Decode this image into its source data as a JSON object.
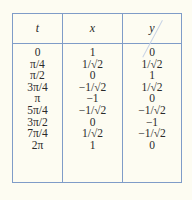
{
  "table": {
    "headers": [
      "t",
      "x",
      "y"
    ],
    "rows": [
      [
        "0",
        "1",
        "0"
      ],
      [
        "π/4",
        "1/√2",
        "1/√2"
      ],
      [
        "π/2",
        "0",
        "1"
      ],
      [
        "3π/4",
        "−1/√2",
        "1/√2"
      ],
      [
        "π",
        "−1",
        "0"
      ],
      [
        "5π/4",
        "−1/√2",
        "−1/√2"
      ],
      [
        "3π/2",
        "0",
        "−1"
      ],
      [
        "7π/4",
        "1/√2",
        "−1/√2"
      ],
      [
        "2π",
        "1",
        "0"
      ]
    ]
  },
  "colors": {
    "background": "#fdfcf2",
    "border": "#7f9cc8",
    "text": "#2a2a2a"
  }
}
